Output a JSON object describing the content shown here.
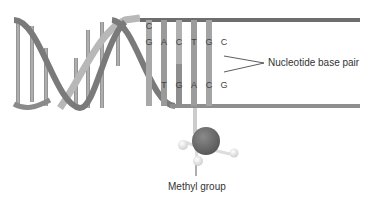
{
  "diagram": {
    "labels": {
      "base_pair": "Nucleotide base pair",
      "methyl": "Methyl group"
    },
    "top_strand_bases": [
      "C",
      "G",
      "A",
      "C",
      "T",
      "G",
      "C"
    ],
    "bottom_strand_bases": [
      "T",
      "G",
      "A",
      "C",
      "G"
    ],
    "colors": {
      "backbone": "#777777",
      "backbone_light": "#aaaaaa",
      "rung": "#999999",
      "rung_light": "#cfcfcf",
      "carbon_atom": "#666666",
      "hydrogen_atom": "#e8e8e8"
    }
  }
}
